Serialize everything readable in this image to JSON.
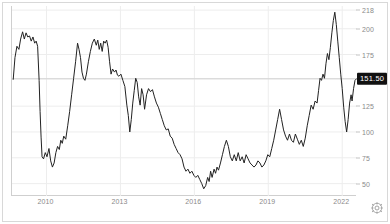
{
  "widget": {
    "name": "price-history-chart",
    "background_color": "#ffffff",
    "border_color": "#d8d8d8",
    "line_color": "#222222",
    "grid_color": "#ededed",
    "axis_color": "#cfcfcf",
    "tick_label_color": "#8a8a8a",
    "badge_bg_color": "#111111",
    "badge_text_color": "#ffffff"
  },
  "controls": {
    "settings_icon": "gear-icon"
  },
  "chart_data": {
    "type": "line",
    "title": "",
    "subtitle": "",
    "xlabel": "",
    "ylabel": "",
    "grid": true,
    "legend": null,
    "legend_position": "none",
    "xlim": [
      2008.6,
      2022.6
    ],
    "ylim": [
      38,
      222
    ],
    "x_ticks": [
      2010,
      2013,
      2016,
      2019,
      2022
    ],
    "x_tick_labels": [
      "2010",
      "2013",
      "2016",
      "2019",
      "2022"
    ],
    "y_ticks": [
      50,
      75,
      100,
      125,
      151.5,
      175,
      200,
      218
    ],
    "y_tick_labels": [
      "50",
      "75",
      "100",
      "125",
      "151.50",
      "175",
      "200",
      "218"
    ],
    "current_value": 151.5,
    "current_value_label": "151.50",
    "reference_line": 151.5,
    "series": [
      {
        "name": "price",
        "color": "#222222",
        "points": [
          [
            2008.65,
            151
          ],
          [
            2008.72,
            172
          ],
          [
            2008.8,
            183
          ],
          [
            2008.88,
            180
          ],
          [
            2008.95,
            190
          ],
          [
            2009.03,
            197
          ],
          [
            2009.1,
            190
          ],
          [
            2009.17,
            196
          ],
          [
            2009.24,
            192
          ],
          [
            2009.31,
            193
          ],
          [
            2009.38,
            188
          ],
          [
            2009.45,
            192
          ],
          [
            2009.52,
            186
          ],
          [
            2009.58,
            188
          ],
          [
            2009.64,
            183
          ],
          [
            2009.7,
            150
          ],
          [
            2009.74,
            120
          ],
          [
            2009.78,
            95
          ],
          [
            2009.82,
            76
          ],
          [
            2009.88,
            74
          ],
          [
            2009.95,
            80
          ],
          [
            2010.02,
            76
          ],
          [
            2010.1,
            84
          ],
          [
            2010.17,
            72
          ],
          [
            2010.24,
            66
          ],
          [
            2010.31,
            70
          ],
          [
            2010.38,
            80
          ],
          [
            2010.45,
            86
          ],
          [
            2010.52,
            83
          ],
          [
            2010.58,
            92
          ],
          [
            2010.64,
            89
          ],
          [
            2010.7,
            96
          ],
          [
            2010.78,
            93
          ],
          [
            2010.86,
            106
          ],
          [
            2010.94,
            120
          ],
          [
            2011.02,
            136
          ],
          [
            2011.1,
            152
          ],
          [
            2011.18,
            168
          ],
          [
            2011.26,
            186
          ],
          [
            2011.32,
            180
          ],
          [
            2011.38,
            172
          ],
          [
            2011.44,
            158
          ],
          [
            2011.5,
            152
          ],
          [
            2011.56,
            150
          ],
          [
            2011.62,
            156
          ],
          [
            2011.7,
            168
          ],
          [
            2011.78,
            178
          ],
          [
            2011.86,
            186
          ],
          [
            2011.94,
            190
          ],
          [
            2012.02,
            184
          ],
          [
            2012.08,
            189
          ],
          [
            2012.14,
            180
          ],
          [
            2012.2,
            186
          ],
          [
            2012.26,
            178
          ],
          [
            2012.32,
            188
          ],
          [
            2012.38,
            186
          ],
          [
            2012.44,
            189
          ],
          [
            2012.5,
            182
          ],
          [
            2012.56,
            168
          ],
          [
            2012.62,
            156
          ],
          [
            2012.68,
            161
          ],
          [
            2012.76,
            158
          ],
          [
            2012.82,
            160
          ],
          [
            2012.88,
            155
          ],
          [
            2012.94,
            154
          ],
          [
            2013.02,
            156
          ],
          [
            2013.1,
            150
          ],
          [
            2013.18,
            144
          ],
          [
            2013.26,
            126
          ],
          [
            2013.32,
            116
          ],
          [
            2013.38,
            100
          ],
          [
            2013.44,
            112
          ],
          [
            2013.5,
            128
          ],
          [
            2013.56,
            140
          ],
          [
            2013.62,
            152
          ],
          [
            2013.68,
            148
          ],
          [
            2013.74,
            134
          ],
          [
            2013.8,
            126
          ],
          [
            2013.86,
            142
          ],
          [
            2013.92,
            136
          ],
          [
            2013.98,
            122
          ],
          [
            2014.06,
            136
          ],
          [
            2014.14,
            142
          ],
          [
            2014.22,
            139
          ],
          [
            2014.3,
            141
          ],
          [
            2014.38,
            134
          ],
          [
            2014.46,
            128
          ],
          [
            2014.54,
            124
          ],
          [
            2014.62,
            118
          ],
          [
            2014.7,
            112
          ],
          [
            2014.78,
            106
          ],
          [
            2014.86,
            102
          ],
          [
            2014.94,
            103
          ],
          [
            2015.02,
            96
          ],
          [
            2015.1,
            94
          ],
          [
            2015.18,
            88
          ],
          [
            2015.26,
            84
          ],
          [
            2015.34,
            80
          ],
          [
            2015.42,
            78
          ],
          [
            2015.5,
            74
          ],
          [
            2015.58,
            66
          ],
          [
            2015.66,
            62
          ],
          [
            2015.74,
            64
          ],
          [
            2015.82,
            60
          ],
          [
            2015.9,
            62
          ],
          [
            2015.98,
            58
          ],
          [
            2016.06,
            56
          ],
          [
            2016.14,
            58
          ],
          [
            2016.22,
            54
          ],
          [
            2016.3,
            50
          ],
          [
            2016.38,
            45
          ],
          [
            2016.46,
            48
          ],
          [
            2016.54,
            56
          ],
          [
            2016.6,
            52
          ],
          [
            2016.66,
            62
          ],
          [
            2016.72,
            56
          ],
          [
            2016.8,
            64
          ],
          [
            2016.86,
            60
          ],
          [
            2016.92,
            66
          ],
          [
            2016.98,
            63
          ],
          [
            2017.06,
            70
          ],
          [
            2017.14,
            78
          ],
          [
            2017.22,
            86
          ],
          [
            2017.3,
            92
          ],
          [
            2017.38,
            86
          ],
          [
            2017.46,
            76
          ],
          [
            2017.54,
            72
          ],
          [
            2017.62,
            78
          ],
          [
            2017.7,
            72
          ],
          [
            2017.78,
            80
          ],
          [
            2017.86,
            72
          ],
          [
            2017.94,
            76
          ],
          [
            2018.02,
            70
          ],
          [
            2018.1,
            78
          ],
          [
            2018.18,
            74
          ],
          [
            2018.26,
            70
          ],
          [
            2018.34,
            68
          ],
          [
            2018.42,
            66
          ],
          [
            2018.5,
            68
          ],
          [
            2018.58,
            72
          ],
          [
            2018.66,
            70
          ],
          [
            2018.74,
            66
          ],
          [
            2018.82,
            68
          ],
          [
            2018.9,
            72
          ],
          [
            2018.98,
            78
          ],
          [
            2019.06,
            76
          ],
          [
            2019.14,
            84
          ],
          [
            2019.22,
            92
          ],
          [
            2019.3,
            102
          ],
          [
            2019.38,
            112
          ],
          [
            2019.46,
            122
          ],
          [
            2019.54,
            112
          ],
          [
            2019.62,
            102
          ],
          [
            2019.7,
            96
          ],
          [
            2019.78,
            92
          ],
          [
            2019.86,
            98
          ],
          [
            2019.94,
            92
          ],
          [
            2020.02,
            90
          ],
          [
            2020.1,
            98
          ],
          [
            2020.18,
            93
          ],
          [
            2020.26,
            88
          ],
          [
            2020.34,
            92
          ],
          [
            2020.42,
            86
          ],
          [
            2020.5,
            94
          ],
          [
            2020.58,
            106
          ],
          [
            2020.66,
            116
          ],
          [
            2020.74,
            126
          ],
          [
            2020.82,
            122
          ],
          [
            2020.9,
            130
          ],
          [
            2020.98,
            128
          ],
          [
            2021.04,
            140
          ],
          [
            2021.1,
            152
          ],
          [
            2021.16,
            150
          ],
          [
            2021.22,
            156
          ],
          [
            2021.28,
            152
          ],
          [
            2021.34,
            166
          ],
          [
            2021.4,
            176
          ],
          [
            2021.46,
            170
          ],
          [
            2021.52,
            182
          ],
          [
            2021.58,
            196
          ],
          [
            2021.64,
            208
          ],
          [
            2021.7,
            216
          ],
          [
            2021.76,
            204
          ],
          [
            2021.82,
            188
          ],
          [
            2021.88,
            172
          ],
          [
            2021.94,
            156
          ],
          [
            2022.0,
            142
          ],
          [
            2022.06,
            124
          ],
          [
            2022.12,
            110
          ],
          [
            2022.18,
            100
          ],
          [
            2022.24,
            112
          ],
          [
            2022.3,
            128
          ],
          [
            2022.36,
            136
          ],
          [
            2022.4,
            130
          ],
          [
            2022.46,
            142
          ],
          [
            2022.52,
            150
          ],
          [
            2022.58,
            151.5
          ]
        ]
      }
    ]
  }
}
